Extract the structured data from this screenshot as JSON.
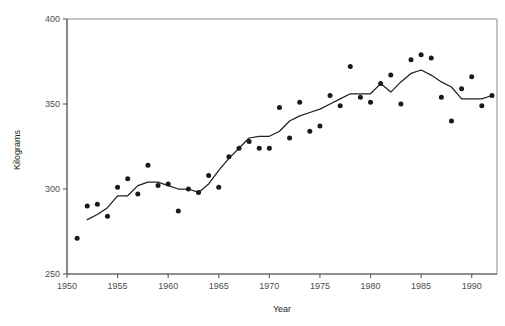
{
  "chart_data": {
    "type": "scatter",
    "title": "",
    "xlabel": "Year",
    "ylabel": "Kilograms",
    "xlim": [
      1950,
      1992.5
    ],
    "ylim": [
      250,
      400
    ],
    "grid": false,
    "legend": "none",
    "xticks": [
      1950,
      1955,
      1960,
      1965,
      1970,
      1975,
      1980,
      1985,
      1990
    ],
    "xticklabels": [
      "1950",
      "1955",
      "1960",
      "1965",
      "1970",
      "1975",
      "1980",
      "1985",
      "1990"
    ],
    "yticks": [
      250,
      300,
      350,
      400
    ],
    "yticklabels": [
      "250",
      "300",
      "350",
      "400"
    ],
    "series": [
      {
        "name": "Annual observations",
        "marker": "filled-circle",
        "color": "#1a1a1a",
        "x": [
          1951,
          1952,
          1953,
          1954,
          1955,
          1956,
          1957,
          1958,
          1959,
          1960,
          1961,
          1962,
          1963,
          1964,
          1965,
          1966,
          1967,
          1968,
          1969,
          1970,
          1971,
          1972,
          1973,
          1974,
          1975,
          1976,
          1977,
          1978,
          1979,
          1980,
          1981,
          1982,
          1983,
          1984,
          1985,
          1986,
          1987,
          1988,
          1989,
          1990,
          1991,
          1992
        ],
        "y": [
          271,
          290,
          291,
          284,
          301,
          306,
          297,
          314,
          302,
          303,
          287,
          300,
          298,
          308,
          301,
          319,
          324,
          328,
          324,
          324,
          348,
          330,
          351,
          334,
          337,
          355,
          349,
          372,
          354,
          351,
          362,
          367,
          350,
          376,
          379,
          377,
          354,
          340,
          359,
          366,
          349,
          355
        ]
      },
      {
        "name": "Smoothed trend",
        "type": "line",
        "color": "#231f20",
        "x": [
          1952,
          1953,
          1954,
          1955,
          1956,
          1957,
          1958,
          1959,
          1960,
          1961,
          1962,
          1963,
          1964,
          1965,
          1966,
          1967,
          1968,
          1969,
          1970,
          1971,
          1972,
          1973,
          1974,
          1975,
          1976,
          1977,
          1978,
          1979,
          1980,
          1981,
          1982,
          1983,
          1984,
          1985,
          1986,
          1987,
          1988,
          1989,
          1990,
          1991,
          1992
        ],
        "y": [
          282,
          285,
          289,
          296,
          296,
          302,
          304,
          304,
          302,
          300,
          300,
          298,
          303,
          311,
          318,
          324,
          330,
          331,
          331,
          334,
          340,
          343,
          345,
          347,
          350,
          353,
          356,
          356,
          356,
          362,
          357,
          363,
          368,
          370,
          367,
          363,
          360,
          353,
          353,
          353,
          355
        ]
      }
    ]
  },
  "axes": {
    "y_label": "Kilograms",
    "x_label": "Year"
  }
}
